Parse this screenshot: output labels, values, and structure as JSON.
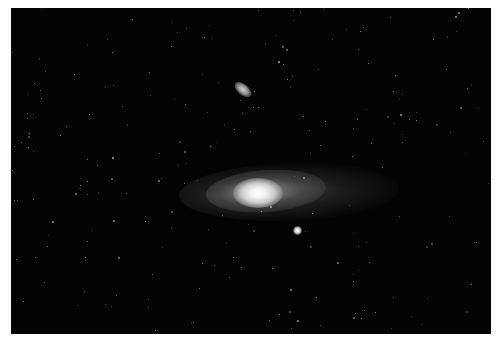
{
  "image": {
    "subject": "spiral galaxy with two satellite galaxies in a star field",
    "background_color": "#030303",
    "border_color": "#ffffff",
    "objects": [
      {
        "name": "main-galaxy",
        "description": "bright elliptical core with faint extended disk"
      },
      {
        "name": "satellite-galaxy-upper",
        "description": "small elongated galaxy above the main galaxy"
      },
      {
        "name": "satellite-galaxy-lower",
        "description": "compact bright round galaxy below-right of core"
      }
    ]
  }
}
